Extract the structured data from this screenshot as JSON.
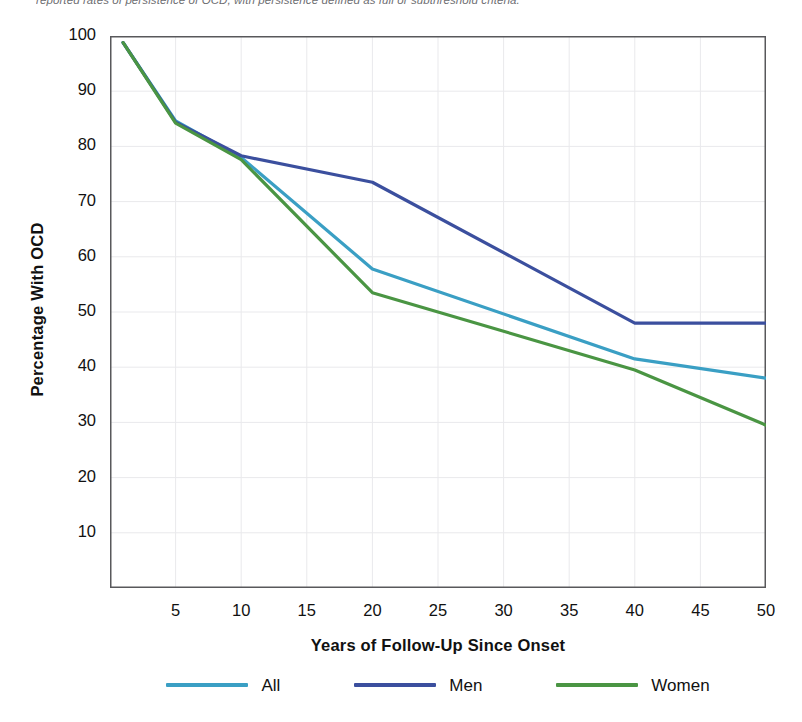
{
  "caption": {
    "text": "reported rates of persistence of OCD, with persistence defined as full or subthreshold criteria."
  },
  "chart_data": {
    "type": "line",
    "title": "",
    "xlabel": "Years of Follow-Up Since Onset",
    "ylabel": "Percentage With OCD",
    "x": [
      1,
      5,
      10,
      20,
      40,
      50
    ],
    "xlim": [
      0,
      50
    ],
    "ylim": [
      0,
      100
    ],
    "xticks": [
      5,
      10,
      15,
      20,
      25,
      30,
      35,
      40,
      45,
      50
    ],
    "yticks": [
      10,
      20,
      30,
      40,
      50,
      60,
      70,
      80,
      90,
      100
    ],
    "grid": "both",
    "legend_position": "bottom",
    "series": [
      {
        "name": "All",
        "color": "#3a9fc4",
        "values": [
          98.8,
          84.6,
          78.0,
          57.8,
          41.5,
          38.0
        ]
      },
      {
        "name": "Men",
        "color": "#3b4f9e",
        "values": [
          98.8,
          84.4,
          78.3,
          73.5,
          48.0,
          48.0
        ]
      },
      {
        "name": "Women",
        "color": "#4a9543",
        "values": [
          98.8,
          84.2,
          77.6,
          53.5,
          39.5,
          29.5
        ]
      }
    ]
  },
  "axes": {
    "ytick_labels": [
      "100",
      "90",
      "80",
      "70",
      "60",
      "50",
      "40",
      "30",
      "20",
      "10"
    ],
    "xtick_labels": [
      "5",
      "10",
      "15",
      "20",
      "25",
      "30",
      "35",
      "40",
      "45",
      "50"
    ]
  },
  "colors": {
    "all": "#3a9fc4",
    "men": "#3b4f9e",
    "women": "#4a9543",
    "axis": "#58585b",
    "grid": "#e9e9ec"
  }
}
